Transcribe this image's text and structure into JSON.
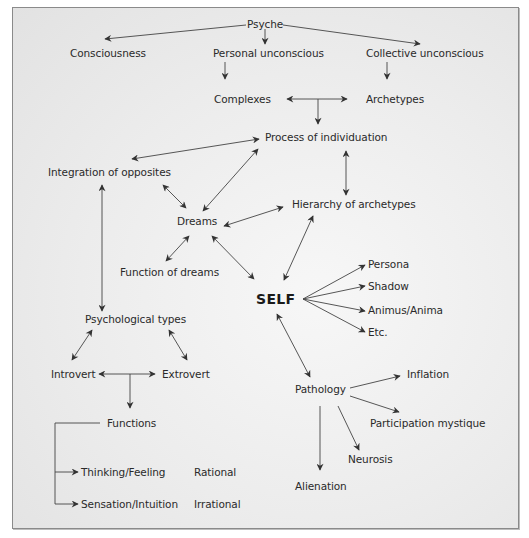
{
  "diagram": {
    "title": "Psyche",
    "colors": {
      "background": "#ececec",
      "border": "#8a8a8a",
      "text": "#2a2a2a",
      "arrow": "#333333"
    },
    "nodes": {
      "psyche": "Psyche",
      "consciousness": "Consciousness",
      "personal_unconscious": "Personal unconscious",
      "collective_unconscious": "Collective unconscious",
      "complexes": "Complexes",
      "archetypes": "Archetypes",
      "process_of_individuation": "Process of individuation",
      "integration_of_opposites": "Integration of opposites",
      "dreams": "Dreams",
      "hierarchy_of_archetypes": "Hierarchy of archetypes",
      "function_of_dreams": "Function of dreams",
      "self": "SELF",
      "persona": "Persona",
      "shadow": "Shadow",
      "animus_anima": "Animus/Anima",
      "etc": "Etc.",
      "psychological_types": "Psychological types",
      "introvert": "Introvert",
      "extrovert": "Extrovert",
      "functions": "Functions",
      "thinking_feeling": "Thinking/Feeling",
      "rational": "Rational",
      "sensation_intuition": "Sensation/Intuition",
      "irrational": "Irrational",
      "pathology": "Pathology",
      "inflation": "Inflation",
      "participation_mystique": "Participation mystique",
      "neurosis": "Neurosis",
      "alienation": "Alienation"
    },
    "edges": [
      {
        "from": "Psyche",
        "to": "Consciousness",
        "type": "directed"
      },
      {
        "from": "Psyche",
        "to": "Personal unconscious",
        "type": "directed"
      },
      {
        "from": "Psyche",
        "to": "Collective unconscious",
        "type": "directed"
      },
      {
        "from": "Personal unconscious",
        "to": "Complexes",
        "type": "directed"
      },
      {
        "from": "Collective unconscious",
        "to": "Archetypes",
        "type": "directed"
      },
      {
        "from": "Complexes/Archetypes",
        "to": "Process of individuation",
        "type": "directed"
      },
      {
        "from": "Process of individuation",
        "to": "Integration of opposites",
        "type": "bidirectional"
      },
      {
        "from": "Process of individuation",
        "to": "Dreams",
        "type": "bidirectional"
      },
      {
        "from": "Process of individuation",
        "to": "Hierarchy of archetypes",
        "type": "bidirectional"
      },
      {
        "from": "Integration of opposites",
        "to": "Dreams",
        "type": "bidirectional"
      },
      {
        "from": "Integration of opposites",
        "to": "Psychological types",
        "type": "bidirectional"
      },
      {
        "from": "Dreams",
        "to": "Hierarchy of archetypes",
        "type": "bidirectional"
      },
      {
        "from": "Dreams",
        "to": "Function of dreams",
        "type": "bidirectional"
      },
      {
        "from": "Dreams",
        "to": "SELF",
        "type": "bidirectional"
      },
      {
        "from": "Hierarchy of archetypes",
        "to": "SELF",
        "type": "bidirectional"
      },
      {
        "from": "SELF",
        "to": "Persona",
        "type": "directed"
      },
      {
        "from": "SELF",
        "to": "Shadow",
        "type": "directed"
      },
      {
        "from": "SELF",
        "to": "Animus/Anima",
        "type": "directed"
      },
      {
        "from": "SELF",
        "to": "Etc.",
        "type": "directed"
      },
      {
        "from": "SELF",
        "to": "Pathology",
        "type": "bidirectional"
      },
      {
        "from": "Psychological types",
        "to": "Introvert",
        "type": "bidirectional"
      },
      {
        "from": "Psychological types",
        "to": "Extrovert",
        "type": "bidirectional"
      },
      {
        "from": "Introvert/Extrovert",
        "to": "Functions",
        "type": "directed"
      },
      {
        "from": "Functions",
        "to": "Thinking/Feeling",
        "type": "directed"
      },
      {
        "from": "Functions",
        "to": "Sensation/Intuition",
        "type": "directed"
      },
      {
        "from": "Pathology",
        "to": "Inflation",
        "type": "directed"
      },
      {
        "from": "Pathology",
        "to": "Participation mystique",
        "type": "directed"
      },
      {
        "from": "Pathology",
        "to": "Neurosis",
        "type": "directed"
      },
      {
        "from": "Pathology",
        "to": "Alienation",
        "type": "directed"
      }
    ]
  }
}
